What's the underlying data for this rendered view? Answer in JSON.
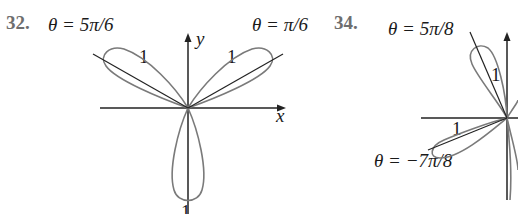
{
  "figures": [
    {
      "number": "32.",
      "curve": "three-leaf rose",
      "labels": {
        "angle_left": "θ = 5π/6",
        "angle_right": "θ = π/6",
        "petal_left": "1",
        "petal_right": "1",
        "petal_bottom": "1",
        "x_axis": "x",
        "y_axis": "y"
      }
    },
    {
      "number": "34.",
      "curve": "four-leaf rose",
      "labels": {
        "angle_top": "θ = 5π/8",
        "angle_bottom": "θ = −7π/8",
        "petal_top": "1",
        "petal_left": "1"
      }
    }
  ],
  "colors": {
    "curve": "#7a7a7a",
    "axis": "#222222",
    "text": "#1a1a1a",
    "number": "#6e6e6e"
  }
}
